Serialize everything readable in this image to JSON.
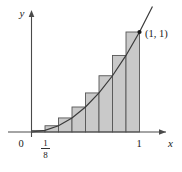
{
  "figure": {
    "axis_labels": {
      "x": "x",
      "y": "y"
    },
    "origin_label": "0",
    "point_label": "(1, 1)",
    "x_ticks": [
      {
        "value": "1/8",
        "numerator": "1",
        "denominator": "8",
        "kind": "fraction"
      },
      {
        "value": "1",
        "numerator": "1",
        "denominator": "",
        "kind": "integer"
      }
    ],
    "colors": {
      "bar_fill": "#c9c9c9",
      "bar_stroke": "#565656",
      "curve": "#3a3a3a",
      "axis": "#4a4a4a",
      "text": "#1a1a1a",
      "background": "#ffffff"
    }
  },
  "chart_data": {
    "type": "bar",
    "title": "",
    "xlabel": "x",
    "ylabel": "y",
    "grid": false,
    "legend": "none",
    "xlim": [
      0,
      1
    ],
    "ylim": [
      0,
      1
    ],
    "annotations": [
      {
        "text": "(1, 1)",
        "x": 1,
        "y": 1
      },
      {
        "text": "0",
        "x": 0,
        "y": 0
      },
      {
        "text": "1/8",
        "x": 0.125,
        "y": 0
      },
      {
        "text": "1",
        "x": 1,
        "y": 0
      }
    ],
    "n_rectangles": 8,
    "rule": "right endpoint",
    "delta_x": 0.125,
    "categories": [
      "1/8",
      "2/8",
      "3/8",
      "4/8",
      "5/8",
      "6/8",
      "7/8",
      "8/8"
    ],
    "values": [
      0.015625,
      0.0625,
      0.140625,
      0.25,
      0.390625,
      0.5625,
      0.765625,
      1.0
    ],
    "series": [
      {
        "name": "f(x) = x^2",
        "type": "line",
        "x": [
          0,
          0.125,
          0.25,
          0.375,
          0.5,
          0.625,
          0.75,
          0.875,
          1.0,
          1.12
        ],
        "values": [
          0,
          0.015625,
          0.0625,
          0.140625,
          0.25,
          0.390625,
          0.5625,
          0.765625,
          1.0,
          1.2544
        ]
      }
    ]
  }
}
